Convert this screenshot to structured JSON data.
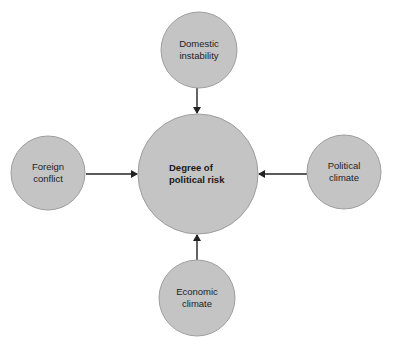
{
  "diagram": {
    "colors": {
      "background": "#ffffff",
      "node_fill": "#c4c4c4",
      "node_stroke": "#9e9e9e",
      "arrow": "#222222",
      "text": "#1e1e1e"
    },
    "center": {
      "id": "degree-of-political-risk",
      "lines": [
        "Degree of",
        "political risk"
      ],
      "cx": 198,
      "cy": 174,
      "r": 60
    },
    "nodes": [
      {
        "id": "domestic-instability",
        "lines": [
          "Domestic",
          "instability"
        ],
        "cx": 199,
        "cy": 50,
        "r": 38,
        "position": "top"
      },
      {
        "id": "foreign-conflict",
        "lines": [
          "Foreign",
          "conflict"
        ],
        "cx": 48,
        "cy": 173,
        "r": 37,
        "position": "left"
      },
      {
        "id": "political-climate",
        "lines": [
          "Political",
          "climate"
        ],
        "cx": 344,
        "cy": 172,
        "r": 37,
        "position": "right"
      },
      {
        "id": "economic-climate",
        "lines": [
          "Economic",
          "climate"
        ],
        "cx": 197,
        "cy": 298,
        "r": 38,
        "position": "bottom"
      }
    ],
    "edges": [
      {
        "from": "domestic-instability",
        "to": "degree-of-political-risk",
        "x1": 197,
        "y1": 88,
        "x2": 197,
        "y2": 113
      },
      {
        "from": "foreign-conflict",
        "to": "degree-of-political-risk",
        "x1": 86,
        "y1": 174,
        "x2": 137,
        "y2": 174
      },
      {
        "from": "political-climate",
        "to": "degree-of-political-risk",
        "x1": 307,
        "y1": 174,
        "x2": 259,
        "y2": 174
      },
      {
        "from": "economic-climate",
        "to": "degree-of-political-risk",
        "x1": 197,
        "y1": 260,
        "x2": 197,
        "y2": 235
      }
    ]
  }
}
